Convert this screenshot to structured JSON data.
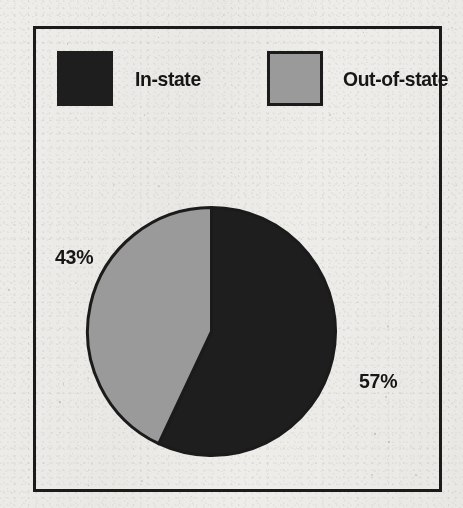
{
  "figure": {
    "background_color": "#eeedea",
    "frame_color": "#1b1b1b"
  },
  "legend": {
    "items": [
      {
        "label": "In-state",
        "swatch": "dark",
        "color": "#1e1e1e"
      },
      {
        "label": "Out-of-state",
        "swatch": "gray",
        "color": "#9a9a9a"
      }
    ]
  },
  "labels": {
    "out_of_state_pct": "43%",
    "in_state_pct": "57%"
  },
  "chart_data": {
    "type": "pie",
    "title": "",
    "subtitle": "",
    "xlabel": "",
    "ylabel": "",
    "grid": false,
    "legend_position": "top",
    "start_angle_deg": 0,
    "direction": "clockwise",
    "categories": [
      "In-state",
      "Out-of-state"
    ],
    "values": [
      57,
      43
    ],
    "value_unit": "percent",
    "data_labels": [
      "57%",
      "43%"
    ],
    "colors": [
      "#1e1e1e",
      "#9a9a9a"
    ],
    "slice_outline_color": "#1b1b1b",
    "slices": [
      {
        "name": "In-state",
        "value": 57,
        "label": "57%",
        "color": "#1e1e1e",
        "start_angle_deg": 0,
        "end_angle_deg": 205.2
      },
      {
        "name": "Out-of-state",
        "value": 43,
        "label": "43%",
        "color": "#9a9a9a",
        "start_angle_deg": 205.2,
        "end_angle_deg": 360
      }
    ]
  }
}
